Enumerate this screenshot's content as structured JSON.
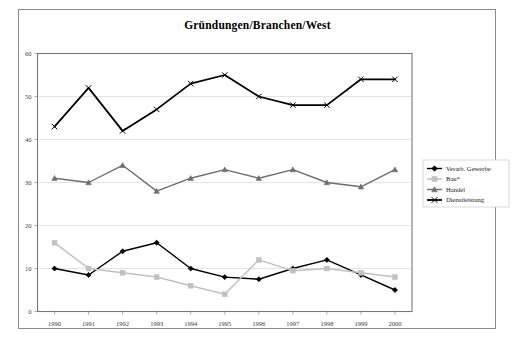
{
  "figure": {
    "title": "Gründungen/Branchen/West",
    "frame_color": "#8a8a8a",
    "background": "#ffffff"
  },
  "legend": {
    "position": "right-middle",
    "entries": [
      {
        "label": "Verarb. Gewerbe",
        "color": "#000000",
        "marker": "diamond"
      },
      {
        "label": "Bau*",
        "color": "#c0c0c0",
        "marker": "square"
      },
      {
        "label": "Handel",
        "color": "#6e6e6e",
        "marker": "triangle"
      },
      {
        "label": "Dienstleistung",
        "color": "#000000",
        "marker": "x"
      }
    ]
  },
  "chart_data": {
    "type": "line",
    "title": "Gründungen/Branchen/West",
    "xlabel": "",
    "ylabel": "",
    "categories": [
      "1990",
      "1991",
      "1992",
      "1993",
      "1994",
      "1995",
      "1996",
      "1997",
      "1998",
      "1999",
      "2000"
    ],
    "ylim": [
      0,
      60
    ],
    "yticks": [
      0,
      10,
      20,
      30,
      40,
      50,
      60
    ],
    "grid": true,
    "legend_position": "right",
    "series": [
      {
        "name": "Verarb. Gewerbe",
        "color": "#000000",
        "marker": "diamond",
        "values": [
          10,
          8.5,
          14,
          16,
          10,
          8,
          7.5,
          10,
          12,
          8.5,
          5
        ]
      },
      {
        "name": "Bau*",
        "color": "#c0c0c0",
        "marker": "square",
        "values": [
          16,
          10,
          9,
          8,
          6,
          4,
          12,
          9.5,
          10,
          9,
          8
        ]
      },
      {
        "name": "Handel",
        "color": "#6e6e6e",
        "marker": "triangle",
        "values": [
          31,
          30,
          34,
          28,
          31,
          33,
          31,
          33,
          30,
          29,
          33
        ]
      },
      {
        "name": "Dienstleistung",
        "color": "#000000",
        "marker": "x",
        "values": [
          43,
          52,
          42,
          47,
          53,
          55,
          50,
          48,
          48,
          54,
          54
        ]
      }
    ]
  }
}
